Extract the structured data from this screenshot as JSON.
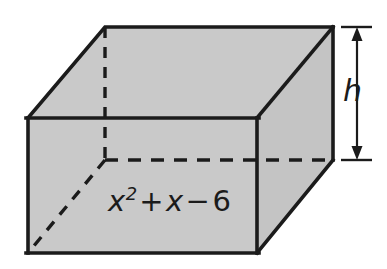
{
  "figure": {
    "name": "rectangular-prism-volume-diagram",
    "type": "geometry-diagram",
    "shape": "rectangular prism",
    "background_color": "#ffffff",
    "stroke_color": "#1b1b1b",
    "face_fill_color": "#c9c9c9",
    "labels": {
      "base_area": {
        "text": "x^2 + x - 6",
        "base": "x",
        "exponent": "2",
        "plus_operator": "+",
        "second_term": "x",
        "minus_operator": "−",
        "constant": "6",
        "meaning": "area of base face"
      },
      "height": {
        "text": "h",
        "meaning": "height of prism"
      }
    },
    "annotations": {
      "dimension_arrow": {
        "name": "height-dimension-arrow",
        "orientation": "vertical",
        "double_headed": true,
        "extension_ticks": 2
      },
      "hidden_edges_style": "dashed",
      "visible_edges_style": "solid"
    },
    "geometry": {
      "front_top_left": [
        28,
        118
      ],
      "front_top_right": [
        257,
        118
      ],
      "front_bottom_left": [
        28,
        253
      ],
      "front_bottom_right": [
        257,
        253
      ],
      "back_top_left": [
        105,
        27
      ],
      "back_top_right": [
        333,
        27
      ],
      "back_bottom_left": [
        105,
        160
      ],
      "back_bottom_right": [
        333,
        160
      ]
    }
  }
}
